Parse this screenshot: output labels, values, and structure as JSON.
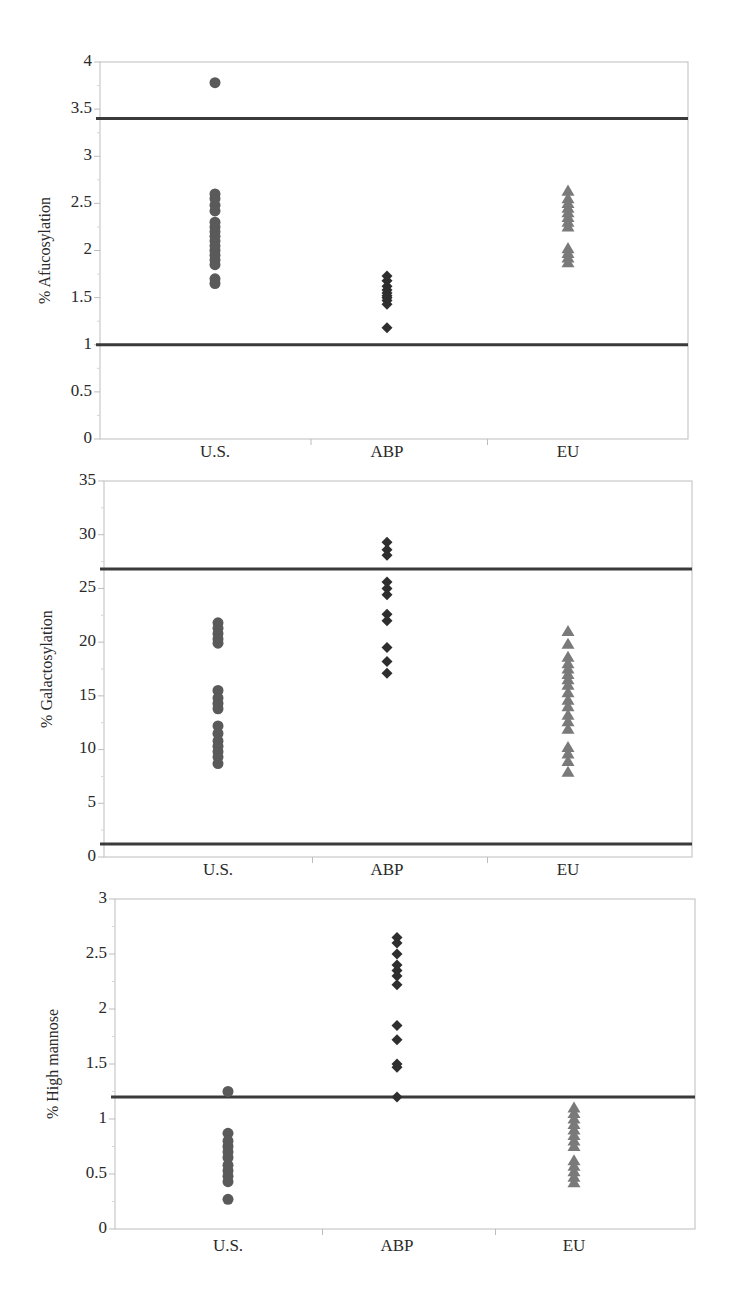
{
  "colors": {
    "us_marker": "#5a5a5a",
    "abp_marker": "#2e2e2e",
    "eu_marker": "#7a7a7a",
    "reference_line": "#3a3a3a",
    "frame": "#c8c8c8"
  },
  "chart_data": [
    {
      "type": "scatter",
      "title": "",
      "xlabel": "",
      "ylabel": "% Afucosylation",
      "categories": [
        "U.S.",
        "ABP",
        "EU"
      ],
      "ylim": [
        0,
        4
      ],
      "yticks": [
        "0",
        "0.5",
        "1",
        "1.5",
        "2",
        "2.5",
        "3",
        "3.5",
        "4"
      ],
      "grid": false,
      "reference_lines": [
        3.4,
        1.0
      ],
      "series": [
        {
          "name": "U.S.",
          "marker": "circle",
          "values": [
            3.78,
            2.6,
            2.55,
            2.48,
            2.42,
            2.3,
            2.25,
            2.2,
            2.15,
            2.1,
            2.05,
            2.0,
            1.95,
            1.9,
            1.85,
            1.7,
            1.65
          ]
        },
        {
          "name": "ABP",
          "marker": "diamond",
          "values": [
            1.73,
            1.68,
            1.62,
            1.58,
            1.55,
            1.52,
            1.5,
            1.47,
            1.43,
            1.18
          ]
        },
        {
          "name": "EU",
          "marker": "triangle",
          "values": [
            2.63,
            2.55,
            2.5,
            2.45,
            2.4,
            2.35,
            2.3,
            2.25,
            2.02,
            1.97,
            1.92,
            1.87
          ]
        }
      ]
    },
    {
      "type": "scatter",
      "title": "",
      "xlabel": "",
      "ylabel": "% Galactosylation",
      "categories": [
        "U.S.",
        "ABP",
        "EU"
      ],
      "ylim": [
        0,
        35
      ],
      "yticks": [
        "0",
        "5",
        "10",
        "15",
        "20",
        "25",
        "30",
        "35"
      ],
      "grid": false,
      "reference_lines": [
        26.8,
        1.2
      ],
      "series": [
        {
          "name": "U.S.",
          "marker": "circle",
          "values": [
            21.8,
            21.3,
            20.8,
            20.3,
            19.9,
            15.5,
            14.8,
            14.3,
            13.8,
            12.2,
            11.5,
            10.8,
            10.3,
            9.8,
            9.3,
            8.7
          ]
        },
        {
          "name": "ABP",
          "marker": "diamond",
          "values": [
            29.3,
            28.6,
            28.1,
            25.6,
            25.0,
            24.4,
            22.6,
            22.0,
            19.5,
            18.2,
            17.1
          ]
        },
        {
          "name": "EU",
          "marker": "triangle",
          "values": [
            21.0,
            19.8,
            18.6,
            18.0,
            17.5,
            17.0,
            16.5,
            16.0,
            15.3,
            14.6,
            14.0,
            13.2,
            12.6,
            11.9,
            10.2,
            9.6,
            8.9,
            7.9
          ]
        }
      ]
    },
    {
      "type": "scatter",
      "title": "",
      "xlabel": "",
      "ylabel": "% High mannose",
      "categories": [
        "U.S.",
        "ABP",
        "EU"
      ],
      "ylim": [
        0,
        3
      ],
      "yticks": [
        "0",
        "0.5",
        "1",
        "1.5",
        "2",
        "2.5",
        "3"
      ],
      "grid": false,
      "reference_lines": [
        1.2
      ],
      "series": [
        {
          "name": "U.S.",
          "marker": "circle",
          "values": [
            1.25,
            0.87,
            0.8,
            0.75,
            0.7,
            0.65,
            0.58,
            0.53,
            0.48,
            0.43,
            0.27
          ]
        },
        {
          "name": "ABP",
          "marker": "diamond",
          "values": [
            2.65,
            2.6,
            2.5,
            2.4,
            2.35,
            2.3,
            2.22,
            1.85,
            1.72,
            1.5,
            1.47,
            1.2
          ]
        },
        {
          "name": "EU",
          "marker": "triangle",
          "values": [
            1.1,
            1.05,
            1.0,
            0.95,
            0.9,
            0.85,
            0.8,
            0.75,
            0.62,
            0.57,
            0.52,
            0.47,
            0.42
          ]
        }
      ]
    }
  ]
}
